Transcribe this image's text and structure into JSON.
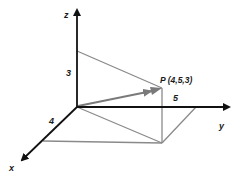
{
  "diagram": {
    "type": "3d-coordinate-axes",
    "axes": {
      "x_label": "x",
      "y_label": "y",
      "z_label": "z"
    },
    "point": {
      "label": "P (4,5,3)",
      "x": 4,
      "y": 5,
      "z": 3
    },
    "dimension_labels": {
      "x_length": "4",
      "y_length": "5",
      "z_length": "3"
    },
    "colors": {
      "axis": "#111111",
      "guide": "#8a8a8a",
      "vector": "#7a7a7a",
      "background": "#ffffff"
    }
  }
}
